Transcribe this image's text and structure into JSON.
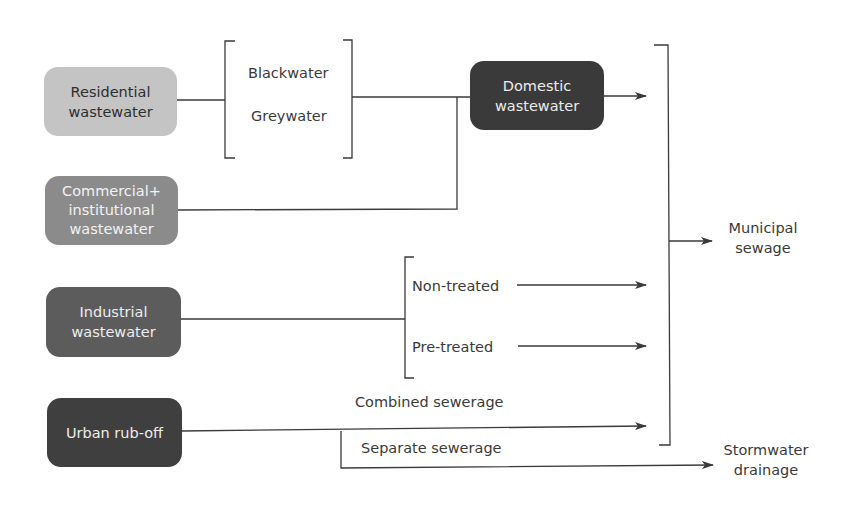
{
  "diagram": {
    "type": "flowchart",
    "title": "",
    "sources": [
      {
        "id": "residential",
        "label": "Residential\nwastewater",
        "fill": "#c4c4c4",
        "text_color": "#2e2e2e"
      },
      {
        "id": "commercial",
        "label": "Commercial+\ninstitutional\nwastewater",
        "fill": "#8b8b8b",
        "text_color": "#f2f2f2"
      },
      {
        "id": "industrial",
        "label": "Industrial\nwastewater",
        "fill": "#5c5c5c",
        "text_color": "#ededed"
      },
      {
        "id": "urban",
        "label": "Urban rub-off",
        "fill": "#3f3f3f",
        "text_color": "#ededed"
      }
    ],
    "intermediate": {
      "domestic": {
        "label": "Domestic\nwastewater",
        "fill": "#3a3a3a",
        "text_color": "#ececec"
      }
    },
    "residential_components": {
      "items": [
        "Blackwater",
        "Greywater"
      ]
    },
    "industrial_components": {
      "items": [
        "Non-treated",
        "Pre-treated"
      ]
    },
    "urban_paths": {
      "combined": "Combined sewerage",
      "separate": "Separate sewerage"
    },
    "outputs": {
      "municipal": "Municipal\nsewage",
      "stormwater": "Stormwater\ndrainage"
    },
    "edges": [
      {
        "from": "Residential wastewater",
        "to": "Blackwater/Greywater"
      },
      {
        "from": "Blackwater/Greywater",
        "to": "Domestic wastewater"
      },
      {
        "from": "Commercial+institutional wastewater",
        "to": "Domestic wastewater"
      },
      {
        "from": "Domestic wastewater",
        "to": "Municipal sewage"
      },
      {
        "from": "Industrial wastewater",
        "to": "Non-treated"
      },
      {
        "from": "Industrial wastewater",
        "to": "Pre-treated"
      },
      {
        "from": "Non-treated",
        "to": "Municipal sewage"
      },
      {
        "from": "Pre-treated",
        "to": "Municipal sewage"
      },
      {
        "from": "Urban rub-off",
        "to": "Municipal sewage",
        "label": "Combined sewerage"
      },
      {
        "from": "Urban rub-off",
        "to": "Stormwater drainage",
        "label": "Separate sewerage"
      }
    ],
    "line_color": "#3a3a3a"
  }
}
